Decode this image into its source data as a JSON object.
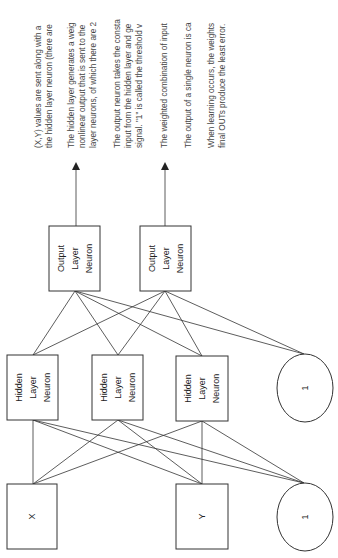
{
  "diagram": {
    "orientation": "rotated-90-ccw",
    "inputs": [
      {
        "label": "X"
      },
      {
        "label": "Y"
      },
      {
        "label": "1"
      }
    ],
    "hidden": [
      {
        "lines": [
          "Hidden",
          "Layer",
          "Neuron"
        ]
      },
      {
        "lines": [
          "Hidden",
          "Layer",
          "Neuron"
        ]
      },
      {
        "lines": [
          "Hidden",
          "Layer",
          "Neuron"
        ]
      },
      {
        "label": "1"
      }
    ],
    "outputs": [
      {
        "lines": [
          "Output",
          "Layer",
          "Neuron"
        ]
      },
      {
        "lines": [
          "Output",
          "Layer",
          "Neuron"
        ]
      }
    ]
  },
  "notes": {
    "lines": [
      "(X,Y) values are sent along with a",
      "the hidden layer neuron (there are",
      "The hidden layer generates a weig",
      "nonlinear output that is sent to the",
      "layer neurons, of which there are 2",
      "The output neuron takes the consta",
      "input from the hidden layer and ge",
      "signal. \"1\" is called the threshold v",
      "The weighted combination of input",
      "The output of a single neuron is ca",
      "When learning occurs, the weights",
      "final OUTs produce the least error."
    ]
  }
}
